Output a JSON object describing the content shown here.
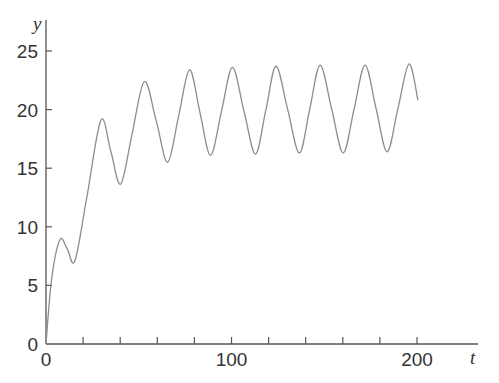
{
  "chart_data": {
    "type": "line",
    "title": "",
    "xlabel": "t",
    "ylabel": "y",
    "xlim": [
      0,
      232
    ],
    "ylim": [
      0,
      27.5
    ],
    "x_ticks_major": [
      0,
      100,
      200
    ],
    "x_ticks_minor": [
      20,
      40,
      60,
      80,
      120,
      140,
      160,
      180
    ],
    "x_tick_labels": [
      "0",
      "100",
      "200"
    ],
    "y_ticks": [
      0,
      5,
      10,
      15,
      20,
      25
    ],
    "y_tick_labels": [
      "0",
      "5",
      "10",
      "15",
      "20",
      "25"
    ],
    "grid": false,
    "legend": null,
    "series": [
      {
        "name": "y(t)",
        "color": "#8c8c8c",
        "x": [
          0,
          3,
          7.5,
          11.5,
          15.6,
          22,
          29.6,
          35,
          40.3,
          46.5,
          53,
          59.5,
          65.6,
          71.5,
          77.4,
          83,
          88.7,
          94.6,
          100.5,
          106.7,
          112.9,
          118.5,
          124,
          130.3,
          136.6,
          142.2,
          147.8,
          154,
          160.2,
          166.1,
          172,
          178,
          183.9,
          189.8,
          195.7,
          200.5
        ],
        "y": [
          0,
          5.5,
          8.9,
          8.1,
          7.1,
          12.5,
          19.1,
          16.4,
          13.65,
          18.0,
          22.4,
          19.0,
          15.5,
          19.45,
          23.4,
          19.75,
          16.1,
          19.85,
          23.6,
          19.9,
          16.2,
          19.95,
          23.7,
          20.0,
          16.3,
          20.05,
          23.8,
          20.05,
          16.3,
          20.05,
          23.8,
          20.05,
          16.4,
          20.15,
          23.9,
          20.8
        ]
      }
    ],
    "axis_color": "#555555"
  }
}
